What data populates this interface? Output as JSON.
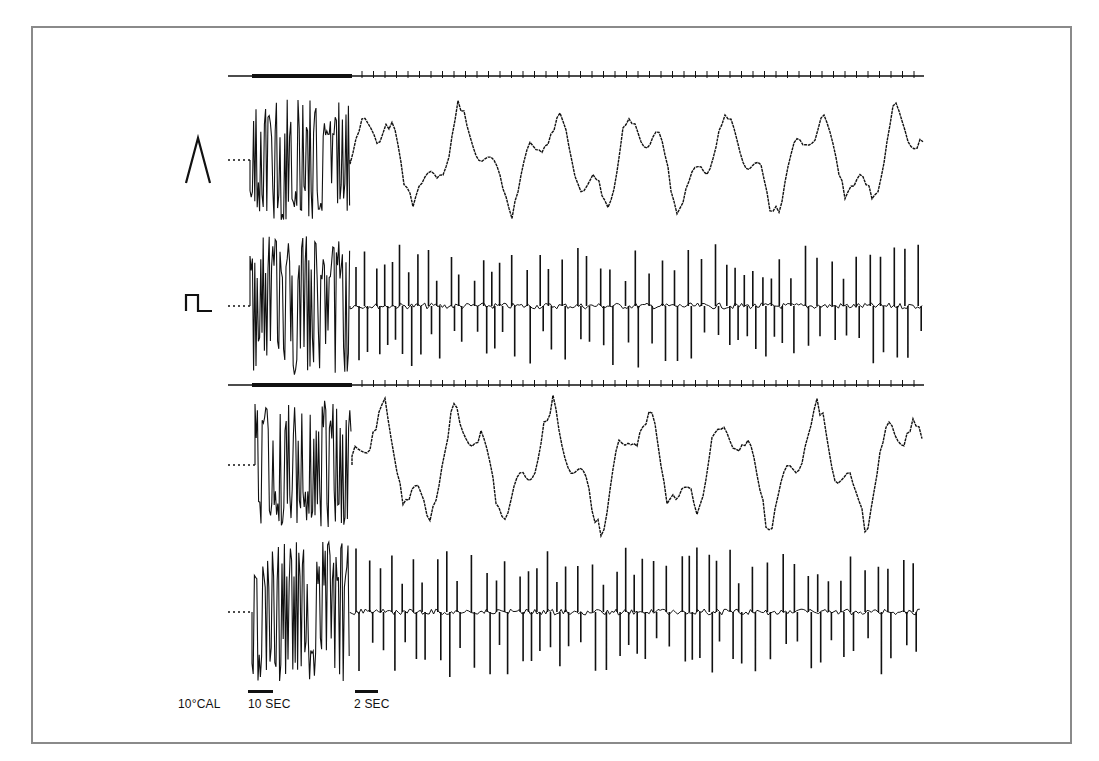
{
  "figure": {
    "frame": {
      "x": 31,
      "y": 26,
      "w": 1041,
      "h": 718,
      "border_color": "#8a8a8a"
    },
    "ink_color": "#111111",
    "symbols": {
      "triangle_wave": "Λ",
      "square_wave": "⎍"
    },
    "time_markers": [
      {
        "name": "upper-time-marker",
        "y": 76,
        "x0": 228,
        "x1": 924,
        "heavy_x0": 252,
        "heavy_x1": 352
      },
      {
        "name": "lower-time-marker",
        "y": 385,
        "x0": 228,
        "x1": 924,
        "heavy_x0": 252,
        "heavy_x1": 352
      }
    ],
    "traces": [
      {
        "name": "trace-1-triangle-stimulus",
        "baseline_y": 160,
        "x0": 228,
        "burst_x0": 250,
        "burst_x1": 350,
        "end_x": 924,
        "amp_burst": 62,
        "amp_after": 50,
        "kind": "slow",
        "seed": 3,
        "symbol": "triangle_wave",
        "symbol_x": 186,
        "symbol_y": 138
      },
      {
        "name": "trace-2-square-stimulus",
        "baseline_y": 306,
        "x0": 228,
        "burst_x0": 250,
        "burst_x1": 350,
        "end_x": 924,
        "amp_burst": 70,
        "amp_after": 62,
        "kind": "spiky",
        "seed": 7,
        "symbol": "square_wave",
        "symbol_x": 186,
        "symbol_y": 295
      },
      {
        "name": "trace-3-slow",
        "baseline_y": 465,
        "x0": 228,
        "burst_x0": 255,
        "burst_x1": 352,
        "end_x": 922,
        "amp_burst": 65,
        "amp_after": 60,
        "kind": "slow",
        "seed": 11,
        "symbol": "",
        "symbol_x": 0,
        "symbol_y": 0
      },
      {
        "name": "trace-4-spiky",
        "baseline_y": 612,
        "x0": 228,
        "burst_x0": 252,
        "burst_x1": 350,
        "end_x": 920,
        "amp_burst": 70,
        "amp_after": 65,
        "kind": "spiky",
        "seed": 19,
        "symbol": "",
        "symbol_x": 0,
        "symbol_y": 0
      }
    ],
    "calibration": {
      "label": "10°CAL",
      "label_x": 178,
      "label_y": 697
    },
    "scale_bars": [
      {
        "label": "10 SEC",
        "bar_x": 248,
        "bar_w": 25,
        "bar_y": 690,
        "label_x": 248,
        "label_y": 697
      },
      {
        "label": "2 SEC",
        "bar_x": 355,
        "bar_w": 23,
        "bar_y": 690,
        "label_x": 354,
        "label_y": 697
      }
    ]
  }
}
